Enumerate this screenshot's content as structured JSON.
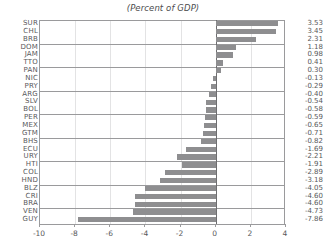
{
  "chart_data": {
    "type": "bar",
    "orientation": "horizontal",
    "title": "(Percent of GDP)",
    "xlabel": "",
    "ylabel": "",
    "xlim": [
      -10,
      4
    ],
    "xticks": [
      -10,
      -8,
      -6,
      -4,
      -2,
      0,
      2,
      4
    ],
    "xtick_labels": [
      "-10",
      "-8",
      "-6",
      "-4",
      "-2",
      "0",
      "2",
      "4"
    ],
    "grid": true,
    "legend": null,
    "bar_color": "#8e8e90",
    "categories": [
      "SUR",
      "CHL",
      "BRB",
      "DOM",
      "JAM",
      "TTO",
      "PAN",
      "NIC",
      "PRY",
      "ARG",
      "SLV",
      "BOL",
      "PER",
      "MEX",
      "GTM",
      "BHS",
      "ECU",
      "URY",
      "HTI",
      "COL",
      "HND",
      "BLZ",
      "CRI",
      "BRA",
      "VEN",
      "GUY"
    ],
    "values": [
      3.53,
      3.45,
      2.31,
      1.18,
      0.98,
      0.41,
      0.3,
      -0.13,
      -0.29,
      -0.4,
      -0.54,
      -0.58,
      -0.59,
      -0.65,
      -0.71,
      -0.82,
      -1.69,
      -2.21,
      -1.91,
      -2.89,
      -3.18,
      -4.05,
      -4.6,
      -4.6,
      -4.73,
      -7.86
    ],
    "value_labels": [
      "3.53",
      "3.45",
      "2.31",
      "1.18",
      "0.98",
      "0.41",
      "0.30",
      "-0.13",
      "-0.29",
      "-0.40",
      "-0.54",
      "-0.58",
      "-0.59",
      "-0.65",
      "-0.71",
      "-0.82",
      "-1.69",
      "-2.21",
      "-1.91",
      "-2.89",
      "-3.18",
      "-4.05",
      "-4.60",
      "-4.60",
      "-4.73",
      "-7.86"
    ]
  }
}
